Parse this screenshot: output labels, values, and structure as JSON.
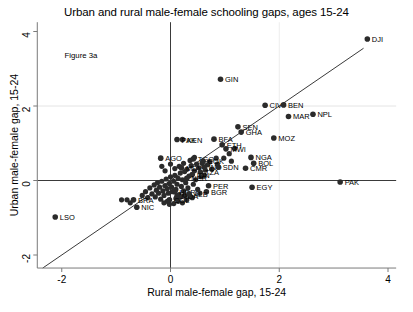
{
  "chart_data": {
    "type": "scatter",
    "title": "Urban and rural male-female schooling gaps, ages 15-24",
    "xlabel": "Rural male-female gap, 15-24",
    "ylabel": "Urban male-female gap, 15-24",
    "annotation": "Figure 3a",
    "xlim": [
      -2.45,
      4.15
    ],
    "ylim": [
      -2.35,
      4.25
    ],
    "xticks": [
      -2,
      0,
      2,
      4
    ],
    "xticklabels": [
      "-2",
      "0",
      "2",
      "4"
    ],
    "yticks": [
      -2,
      0,
      2,
      4
    ],
    "yticklabels": [
      "-2",
      "0",
      "2",
      "4"
    ],
    "grid": "faint horizontal gridline at y=2 and vertical gridline at x=2",
    "reference_lines": [
      {
        "name": "forty-five-degree-line",
        "type": "identity",
        "from": [
          -2.35,
          -2.35
        ],
        "to": [
          3.55,
          3.55
        ]
      },
      {
        "name": "zero-horizontal-axis",
        "type": "hline",
        "value": 0
      },
      {
        "name": "zero-vertical-axis",
        "type": "vline",
        "value": 0
      }
    ],
    "marker_color": "#2b2b2b",
    "points": [
      {
        "label": "DJI",
        "x": 3.62,
        "y": 3.8,
        "lpos": "right"
      },
      {
        "label": "GIN",
        "x": 0.92,
        "y": 2.72,
        "lpos": "right"
      },
      {
        "label": "CIV",
        "x": 1.74,
        "y": 2.02,
        "lpos": "right"
      },
      {
        "label": "BEN",
        "x": 2.08,
        "y": 2.03,
        "lpos": "right"
      },
      {
        "label": "MAR",
        "x": 2.17,
        "y": 1.72,
        "lpos": "right"
      },
      {
        "label": "NPL",
        "x": 2.62,
        "y": 1.78,
        "lpos": "right"
      },
      {
        "label": "SEN",
        "x": 1.24,
        "y": 1.44,
        "lpos": "right"
      },
      {
        "label": "GHA",
        "x": 1.3,
        "y": 1.3,
        "lpos": "right"
      },
      {
        "label": "MOZ",
        "x": 1.9,
        "y": 1.14,
        "lpos": "right"
      },
      {
        "label": "BFA",
        "x": 0.8,
        "y": 1.11,
        "lpos": "right"
      },
      {
        "label": "ETH",
        "x": 0.95,
        "y": 0.96,
        "lpos": "right"
      },
      {
        "label": "MWI",
        "x": 1.02,
        "y": 0.85,
        "lpos": "right"
      },
      {
        "label": "KEN",
        "x": 0.22,
        "y": 1.1,
        "lpos": "right"
      },
      {
        "label": "PAK",
        "x": 0.12,
        "y": 1.1,
        "lpos": "right"
      },
      {
        "label": "NGA",
        "x": 1.48,
        "y": 0.62,
        "lpos": "right"
      },
      {
        "label": "BOL",
        "x": 1.53,
        "y": 0.46,
        "lpos": "right"
      },
      {
        "label": "CMR",
        "x": 1.38,
        "y": 0.33,
        "lpos": "right"
      },
      {
        "label": "AGO",
        "x": -0.18,
        "y": 0.6,
        "lpos": "right"
      },
      {
        "label": "TGO",
        "x": 0.42,
        "y": 0.58,
        "lpos": "right"
      },
      {
        "label": "COK",
        "x": 0.6,
        "y": 0.52,
        "lpos": "right"
      },
      {
        "label": "MDV",
        "x": 0.2,
        "y": 0.34,
        "lpos": "right"
      },
      {
        "label": "IND",
        "x": 0.62,
        "y": 0.36,
        "lpos": "right"
      },
      {
        "label": "SDN",
        "x": 0.88,
        "y": 0.36,
        "lpos": "right"
      },
      {
        "label": "TZA",
        "x": 0.55,
        "y": 0.22,
        "lpos": "right"
      },
      {
        "label": "IDN",
        "x": 0.4,
        "y": 0.16,
        "lpos": "right"
      },
      {
        "label": "NER",
        "x": 0.3,
        "y": 0.06,
        "lpos": "right"
      },
      {
        "label": "PER",
        "x": 0.7,
        "y": -0.14,
        "lpos": "right"
      },
      {
        "label": "BGR",
        "x": 0.66,
        "y": -0.3,
        "lpos": "right"
      },
      {
        "label": "EGY",
        "x": 1.5,
        "y": -0.18,
        "lpos": "right"
      },
      {
        "label": "HDR",
        "x": 0.08,
        "y": -0.3,
        "lpos": "right"
      },
      {
        "label": "MDA",
        "x": 0.12,
        "y": -0.42,
        "lpos": "right"
      },
      {
        "label": "ALB",
        "x": 0.34,
        "y": -0.36,
        "lpos": "right"
      },
      {
        "label": "COL",
        "x": -0.02,
        "y": -0.52,
        "lpos": "right"
      },
      {
        "label": "BRA",
        "x": -0.68,
        "y": -0.52,
        "lpos": "right"
      },
      {
        "label": "NIC",
        "x": -0.62,
        "y": -0.72,
        "lpos": "right"
      },
      {
        "label": "LSO",
        "x": -2.12,
        "y": -0.98,
        "lpos": "right"
      },
      {
        "label": "PAK2",
        "x": 3.12,
        "y": -0.04,
        "lpos": "right",
        "display": "PAK"
      }
    ],
    "unlabeled_points": [
      [
        -0.9,
        -0.52
      ],
      [
        -0.8,
        -0.52
      ],
      [
        -0.74,
        -0.6
      ],
      [
        -0.52,
        -0.4
      ],
      [
        -0.46,
        -0.3
      ],
      [
        -0.42,
        -0.46
      ],
      [
        -0.38,
        -0.2
      ],
      [
        -0.34,
        -0.36
      ],
      [
        -0.3,
        -0.12
      ],
      [
        -0.28,
        -0.44
      ],
      [
        -0.26,
        -0.26
      ],
      [
        -0.24,
        -0.06
      ],
      [
        -0.22,
        -0.34
      ],
      [
        -0.2,
        -0.18
      ],
      [
        -0.18,
        -0.5
      ],
      [
        -0.16,
        -0.02
      ],
      [
        -0.14,
        -0.28
      ],
      [
        -0.12,
        -0.4
      ],
      [
        -0.1,
        -0.14
      ],
      [
        -0.08,
        0.04
      ],
      [
        -0.06,
        -0.22
      ],
      [
        -0.04,
        -0.34
      ],
      [
        -0.02,
        -0.08
      ],
      [
        0.0,
        0.1
      ],
      [
        0.02,
        -0.18
      ],
      [
        0.04,
        -0.3
      ],
      [
        0.06,
        -0.02
      ],
      [
        0.08,
        0.14
      ],
      [
        0.1,
        -0.24
      ],
      [
        0.12,
        -0.1
      ],
      [
        0.14,
        0.06
      ],
      [
        0.16,
        -0.38
      ],
      [
        0.18,
        0.2
      ],
      [
        0.2,
        -0.16
      ],
      [
        0.22,
        0.02
      ],
      [
        0.24,
        -0.28
      ],
      [
        0.26,
        0.24
      ],
      [
        0.28,
        -0.06
      ],
      [
        0.3,
        0.3
      ],
      [
        0.32,
        -0.2
      ],
      [
        0.34,
        0.12
      ],
      [
        0.36,
        -0.42
      ],
      [
        0.38,
        0.4
      ],
      [
        0.42,
        -0.1
      ],
      [
        0.44,
        0.26
      ],
      [
        0.46,
        0.02
      ],
      [
        0.48,
        0.44
      ],
      [
        0.52,
        0.34
      ],
      [
        0.56,
        0.1
      ],
      [
        0.58,
        0.46
      ],
      [
        0.64,
        0.28
      ],
      [
        0.72,
        0.5
      ],
      [
        0.76,
        0.3
      ],
      [
        0.84,
        0.6
      ],
      [
        0.5,
        -0.24
      ],
      [
        0.54,
        -0.34
      ],
      [
        0.4,
        -0.46
      ],
      [
        0.3,
        -0.52
      ],
      [
        0.22,
        -0.6
      ],
      [
        0.14,
        -0.56
      ],
      [
        0.06,
        -0.62
      ],
      [
        -0.02,
        -0.64
      ],
      [
        0.18,
        -0.44
      ],
      [
        0.26,
        -0.4
      ],
      [
        0.1,
        -0.48
      ],
      [
        -0.06,
        -0.56
      ],
      [
        -0.12,
        -0.6
      ],
      [
        0.62,
        0.14
      ],
      [
        0.68,
        0.42
      ],
      [
        0.36,
        0.54
      ],
      [
        0.44,
        0.62
      ],
      [
        0.24,
        0.46
      ],
      [
        0.16,
        0.38
      ],
      [
        0.08,
        0.32
      ],
      [
        0.0,
        0.44
      ],
      [
        -0.1,
        0.26
      ],
      [
        -0.16,
        0.38
      ],
      [
        1.08,
        0.72
      ],
      [
        1.18,
        0.86
      ],
      [
        0.98,
        0.6
      ],
      [
        1.12,
        0.52
      ],
      [
        0.86,
        0.44
      ]
    ]
  }
}
